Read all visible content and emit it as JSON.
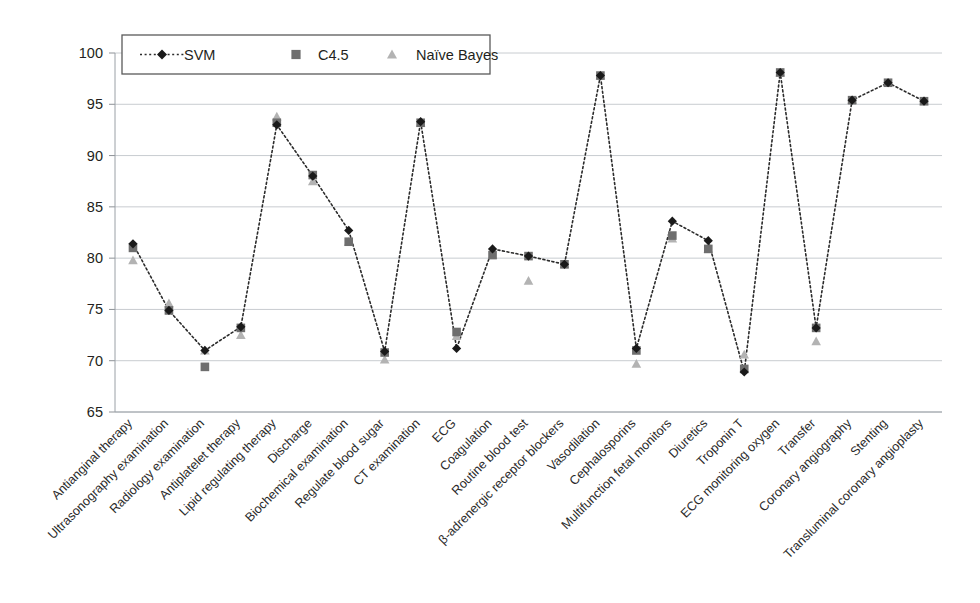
{
  "chart_data": {
    "type": "line",
    "title": "",
    "xlabel": "",
    "ylabel": "Precision (%)",
    "ylim": [
      65,
      100
    ],
    "yticks": [
      65,
      70,
      75,
      80,
      85,
      90,
      95,
      100
    ],
    "grid": true,
    "legend_position": "top-left",
    "categories": [
      "Antianginal therapy",
      "Ultrasonography examination",
      "Radiology examination",
      "Antiplatelet therapy",
      "Lipid regulating therapy",
      "Discharge",
      "Biochemical examination",
      "Regulate blood sugar",
      "CT examination",
      "ECG",
      "Coagulation",
      "Routine blood test",
      "β-adrenergic receptor blockers",
      "Vasodilation",
      "Cephalosporins",
      "Multifunction fetal monitors",
      "Diuretics",
      "Troponin T",
      "ECG monitoring oxygen",
      "Transfer",
      "Coronary angiography",
      "Stenting",
      "Transluminal coronary angioplasty"
    ],
    "series": [
      {
        "name": "SVM",
        "marker": "diamond",
        "color": "#1a1a1a",
        "line": "dotted",
        "values": [
          81.4,
          74.9,
          71.0,
          73.3,
          93.0,
          88.0,
          82.7,
          70.9,
          93.3,
          71.2,
          80.9,
          80.2,
          79.4,
          97.8,
          71.2,
          83.6,
          81.7,
          68.9,
          98.1,
          73.2,
          95.4,
          97.1,
          95.3
        ]
      },
      {
        "name": "C4.5",
        "marker": "square",
        "color": "#6e6e6e",
        "line": "none",
        "values": [
          81.0,
          74.9,
          69.4,
          73.2,
          93.2,
          88.1,
          81.6,
          70.8,
          93.2,
          72.8,
          80.3,
          80.2,
          79.4,
          97.8,
          71.0,
          82.2,
          80.9,
          69.2,
          98.1,
          73.2,
          95.4,
          97.1,
          95.3
        ]
      },
      {
        "name": "Naïve Bayes",
        "marker": "triangle",
        "color": "#b3b3b3",
        "line": "none",
        "values": [
          79.8,
          75.6,
          71.0,
          72.5,
          93.8,
          87.5,
          81.6,
          70.1,
          93.2,
          72.4,
          80.3,
          77.8,
          79.4,
          97.8,
          69.7,
          81.9,
          80.9,
          70.6,
          98.1,
          71.9,
          95.4,
          97.1,
          95.3
        ]
      }
    ]
  },
  "legend": {
    "items": [
      {
        "label": "SVM"
      },
      {
        "label": "C4.5"
      },
      {
        "label": "Naïve Bayes"
      }
    ]
  },
  "axes": {
    "y_title": "Precision (%)"
  }
}
